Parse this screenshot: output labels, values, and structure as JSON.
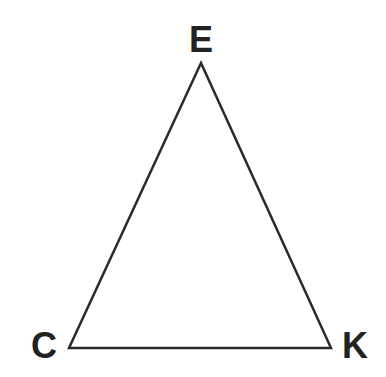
{
  "diagram": {
    "type": "triangle",
    "stroke_color": "#2a2a2a",
    "label_color": "#222222",
    "vertices": [
      {
        "name": "E",
        "x": 201,
        "y": 63,
        "label_x": 201,
        "label_y": 52
      },
      {
        "name": "C",
        "x": 69,
        "y": 348,
        "label_x": 44,
        "label_y": 358
      },
      {
        "name": "K",
        "x": 331,
        "y": 348,
        "label_x": 355,
        "label_y": 358
      }
    ],
    "labels": {
      "top": "E",
      "bottom_left": "C",
      "bottom_right": "K"
    }
  }
}
